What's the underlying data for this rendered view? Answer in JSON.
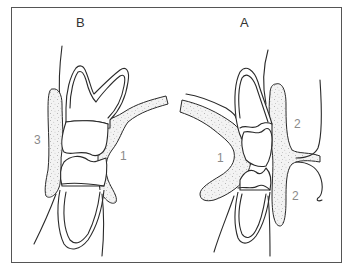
{
  "figure": {
    "panels": [
      {
        "id": "B",
        "label": "B",
        "regions": [
          {
            "label": "3"
          },
          {
            "label": "1"
          }
        ]
      },
      {
        "id": "A",
        "label": "A",
        "regions": [
          {
            "label": "1"
          },
          {
            "label": "2"
          },
          {
            "label": "2"
          }
        ]
      }
    ],
    "colors": {
      "line": "#2a2a2a",
      "frame": "#555555",
      "label_panel": "#333333",
      "label_region": "#8a8a8a",
      "background": "#ffffff"
    }
  }
}
